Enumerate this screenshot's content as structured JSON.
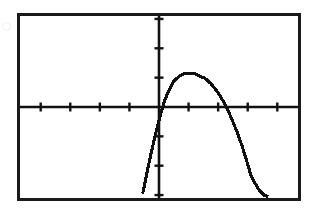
{
  "device": {
    "name": "graphing-calculator-screen",
    "frame_color": "#1a1a1a",
    "screen_background": "#ffffff",
    "trace_color": "#111111"
  },
  "chart_data": {
    "type": "line",
    "title": "",
    "subtitle": "",
    "xlabel": "",
    "ylabel": "",
    "grid": false,
    "legend": null,
    "legend_position": "none",
    "axis_style": "calculator-crosshair",
    "tick_labels_shown": false,
    "xlim": [
      -4.7,
      4.7
    ],
    "ylim": [
      -3.1,
      3.1
    ],
    "xticks": [
      -4,
      -3,
      -2,
      -1,
      1,
      2,
      3,
      4
    ],
    "yticks": [
      -3,
      -2,
      -1,
      1,
      2,
      3
    ],
    "x_tick_count_left_of_origin": 5,
    "x_tick_count_right_of_origin": 5,
    "y_tick_count_above_origin": 4,
    "y_tick_count_below_origin": 4,
    "series": [
      {
        "name": "y1",
        "shape": "downward-parabola",
        "vertex": [
          1.5,
          1.15
        ],
        "roots": [
          0.05,
          2.95
        ],
        "x": [
          -0.55,
          -0.4,
          -0.25,
          -0.1,
          0.05,
          0.2,
          0.35,
          0.5,
          0.65,
          0.8,
          0.95,
          1.1,
          1.25,
          1.4,
          1.5,
          1.6,
          1.75,
          1.9,
          2.05,
          2.2,
          2.35,
          2.5,
          2.65,
          2.8,
          2.95,
          3.1,
          3.25,
          3.4,
          3.55,
          3.7
        ],
        "values": [
          -2.95,
          -2.2,
          -1.5,
          -0.85,
          -0.25,
          0.25,
          0.6,
          0.88,
          1.02,
          1.12,
          1.15,
          1.15,
          1.12,
          1.04,
          1.0,
          0.94,
          0.8,
          0.62,
          0.4,
          0.15,
          -0.15,
          -0.5,
          -0.88,
          -1.3,
          -1.78,
          -2.3,
          -2.6,
          -2.85,
          -3.0,
          -3.05
        ]
      }
    ],
    "annotations": []
  }
}
